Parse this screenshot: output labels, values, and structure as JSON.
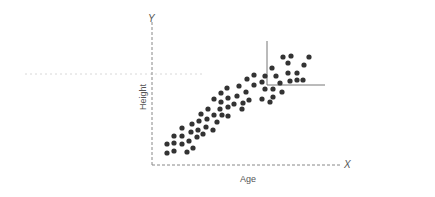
{
  "chart_data": {
    "type": "scatter",
    "title": "",
    "xlabel": "Age",
    "ylabel": "Height",
    "x_axis_letter": "X",
    "y_axis_letter": "Y",
    "grid": false,
    "legend": null,
    "point_color": "#333333",
    "axis_color": "#777777",
    "annotation": "corner bracket (vertical + horizontal solid lines) marking top-right cluster",
    "points_px": [
      [
        167,
        144
      ],
      [
        174,
        143
      ],
      [
        182,
        144
      ],
      [
        167,
        153
      ],
      [
        174,
        151
      ],
      [
        187,
        152
      ],
      [
        193,
        148
      ],
      [
        174,
        136
      ],
      [
        182,
        136
      ],
      [
        189,
        141
      ],
      [
        197,
        137
      ],
      [
        182,
        128
      ],
      [
        191,
        132
      ],
      [
        198,
        130
      ],
      [
        203,
        134
      ],
      [
        192,
        124
      ],
      [
        199,
        121
      ],
      [
        206,
        127
      ],
      [
        213,
        130
      ],
      [
        201,
        114
      ],
      [
        207,
        119
      ],
      [
        214,
        115
      ],
      [
        217,
        122
      ],
      [
        208,
        109
      ],
      [
        220,
        109
      ],
      [
        222,
        115
      ],
      [
        228,
        116
      ],
      [
        214,
        99
      ],
      [
        221,
        93
      ],
      [
        221,
        102
      ],
      [
        228,
        98
      ],
      [
        228,
        107
      ],
      [
        227,
        88
      ],
      [
        234,
        104
      ],
      [
        237,
        96
      ],
      [
        242,
        109
      ],
      [
        243,
        103
      ],
      [
        239,
        86
      ],
      [
        246,
        92
      ],
      [
        249,
        100
      ],
      [
        247,
        79
      ],
      [
        254,
        75
      ],
      [
        254,
        85
      ],
      [
        262,
        82
      ],
      [
        262,
        99
      ],
      [
        265,
        76
      ],
      [
        265,
        89
      ],
      [
        270,
        102
      ],
      [
        273,
        97
      ],
      [
        273,
        89
      ],
      [
        272,
        68
      ],
      [
        276,
        76
      ],
      [
        280,
        83
      ],
      [
        282,
        92
      ],
      [
        283,
        57
      ],
      [
        288,
        63
      ],
      [
        291,
        56
      ],
      [
        288,
        73
      ],
      [
        290,
        81
      ],
      [
        297,
        73
      ],
      [
        297,
        80
      ],
      [
        303,
        80
      ],
      [
        304,
        65
      ],
      [
        309,
        57
      ]
    ]
  }
}
